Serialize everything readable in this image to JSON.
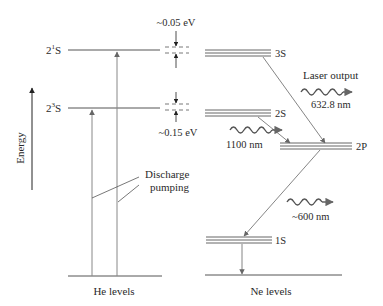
{
  "diagram": {
    "axis": {
      "label": "Energy"
    },
    "he": {
      "label": "He levels",
      "levels": [
        {
          "name": "2",
          "sup": "1",
          "suffix": "S"
        },
        {
          "name": "2",
          "sup": "3",
          "suffix": "S"
        }
      ],
      "pumping_label_line1": "Discharge",
      "pumping_label_line2": "pumping"
    },
    "gaps": [
      {
        "label": "~0.05 eV"
      },
      {
        "label": "~0.15 eV"
      }
    ],
    "ne": {
      "label": "Ne levels",
      "levels": [
        "3S",
        "2S",
        "2P",
        "1S"
      ]
    },
    "emissions": [
      {
        "label_line1": "Laser output",
        "label_line2": "632.8 nm"
      },
      {
        "label": "1100 nm"
      },
      {
        "label": "~600 nm"
      }
    ],
    "colors": {
      "line": "#3a3a3a",
      "arrow": "#777777",
      "text": "#2a2a2a"
    }
  }
}
